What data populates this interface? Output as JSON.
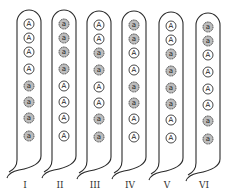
{
  "diagram": {
    "legend_symbols": {
      "dominant": "A",
      "recessive": "a"
    },
    "colors": {
      "stroke": "#2a2a2a",
      "dominant_fill": "#ffffff",
      "recessive_fill": "#bdbdbd"
    },
    "strands": [
      {
        "label": "I",
        "alleles": [
          "A",
          "A",
          "A",
          "A",
          "a",
          "a",
          "a",
          "a"
        ]
      },
      {
        "label": "II",
        "alleles": [
          "a",
          "a",
          "a",
          "a",
          "A",
          "A",
          "A",
          "A"
        ]
      },
      {
        "label": "III",
        "alleles": [
          "A",
          "A",
          "a",
          "a",
          "A",
          "A",
          "a",
          "a"
        ]
      },
      {
        "label": "IV",
        "alleles": [
          "a",
          "a",
          "A",
          "A",
          "a",
          "a",
          "A",
          "A"
        ]
      },
      {
        "label": "V",
        "alleles": [
          "A",
          "A",
          "a",
          "a",
          "a",
          "a",
          "A",
          "A"
        ]
      },
      {
        "label": "VI",
        "alleles": [
          "a",
          "a",
          "A",
          "A",
          "A",
          "A",
          "a",
          "a"
        ]
      }
    ]
  }
}
